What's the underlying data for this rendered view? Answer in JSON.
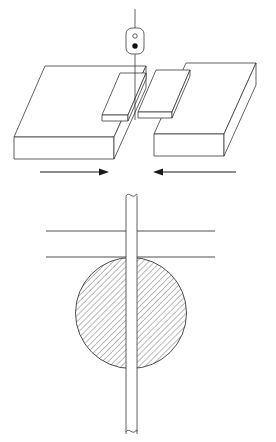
{
  "figure": {
    "background_color": "#ffffff",
    "line_color": "#3a3a3a",
    "accent_color": "#101010",
    "width": 276,
    "height": 442,
    "views": [
      {
        "id": "isometric-view",
        "name": "Isometric assembly view",
        "description": "Two thick plates shown in isometric projection, each carrying a thin overlapping sheet, with a tool positioned above the joint line"
      },
      {
        "id": "section-view",
        "name": "Cross-section view",
        "description": "Vertical pin passing through a hatched circular nugget between two horizontal plate edge lines"
      }
    ]
  },
  "tool": {
    "name": "welding tool head",
    "body_shape": "rounded-rectangle",
    "shank_label": "tool shank",
    "indicator_top": "hollow-circle",
    "indicator_bottom": "filled-dot",
    "body": {
      "x": 126,
      "y": 28,
      "width": 18,
      "height": 25,
      "radius": 6
    },
    "shank": {
      "x": 135,
      "y_top": 9,
      "y_bottom": 28
    },
    "probe": {
      "x": 135,
      "y_top": 53,
      "y_bottom": 118
    },
    "hollow_circle": {
      "cx": 135,
      "cy": 35,
      "r": 2.1
    },
    "filled_dot": {
      "cx": 135,
      "cy": 45,
      "r": 2.6
    }
  },
  "left_plate": {
    "name": "left base plate",
    "top_face": "20,73 48,120 137,120 110,73",
    "top_face_path": "M47.5,119.5 L19.5,119.5 L19.5,138.5 L47.5,158.5 L137,158.5 L137,140",
    "thickness_label": "plate thickness"
  },
  "right_plate": {
    "name": "right base plate",
    "thickness_label": "plate thickness"
  },
  "left_sheet": {
    "name": "left overlapping sheet"
  },
  "right_sheet": {
    "name": "right overlapping sheet"
  },
  "arrows": [
    {
      "id": "arrow-left",
      "name": "left material flow arrow",
      "direction": "right",
      "x1": 40,
      "x2": 108,
      "y": 172
    },
    {
      "id": "arrow-right",
      "name": "right material flow arrow",
      "direction": "left",
      "x1": 236,
      "x2": 154,
      "y": 172
    }
  ],
  "section": {
    "pin": {
      "name": "pin / tool probe",
      "x_left": 126,
      "x_right": 137,
      "y_top": 193,
      "y_bottom": 436,
      "break_top": true,
      "break_bottom": true
    },
    "nugget": {
      "name": "weld nugget cross-section",
      "cx": 131,
      "cy": 313,
      "r": 56,
      "hatch_angle_deg": 45,
      "hatch_spacing_px": 3,
      "hatch_color": "#4a4a4a"
    },
    "plate_edges": [
      {
        "id": "edge-upper-left",
        "x1": 46,
        "x2": 126,
        "y": 231
      },
      {
        "id": "edge-upper-right",
        "x1": 137,
        "x2": 215,
        "y": 231
      },
      {
        "id": "edge-lower-left",
        "x1": 46,
        "x2": 126,
        "y": 257
      },
      {
        "id": "edge-lower-right",
        "x1": 137,
        "x2": 215,
        "y": 257
      }
    ]
  }
}
